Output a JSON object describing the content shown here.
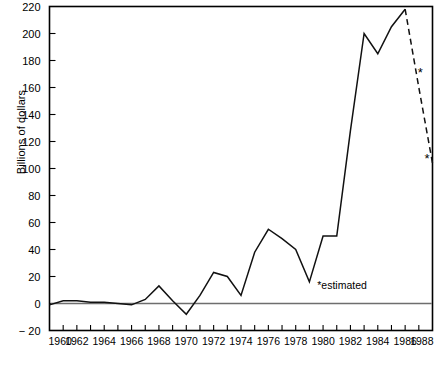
{
  "chart_data": {
    "type": "line",
    "title": "",
    "subtitle": "",
    "xlabel": "",
    "ylabel": "Billions of dollars",
    "xlim": [
      1960,
      1988
    ],
    "ylim": [
      -20,
      220
    ],
    "ytick_step": 20,
    "xtick_step": 1,
    "grid": false,
    "legend_position": "none",
    "yticks": [
      -20,
      0,
      20,
      40,
      60,
      80,
      100,
      120,
      140,
      160,
      180,
      200,
      220
    ],
    "ytick_labels": [
      "− 20",
      "0",
      "20",
      "40",
      "60",
      "80",
      "100",
      "120",
      "140",
      "160",
      "180",
      "200",
      "220"
    ],
    "xticks": [
      1960,
      1962,
      1964,
      1966,
      1968,
      1970,
      1972,
      1974,
      1976,
      1978,
      1980,
      1982,
      1984,
      1986,
      1988
    ],
    "xtick_labels": [
      "1960",
      "1962",
      "1964",
      "1966",
      "1968",
      "1970",
      "1972",
      "1974",
      "1976",
      "1978",
      "1980",
      "1982",
      "1984",
      "1986",
      "1988"
    ],
    "series": [
      {
        "name": "actual",
        "style": "solid",
        "x": [
          1960,
          1961,
          1962,
          1963,
          1964,
          1965,
          1966,
          1967,
          1968,
          1969,
          1970,
          1971,
          1972,
          1973,
          1974,
          1975,
          1976,
          1977,
          1978,
          1979,
          1980,
          1981,
          1982,
          1983,
          1984,
          1985,
          1986
        ],
        "values": [
          -1,
          2,
          2,
          1,
          1,
          0,
          -1,
          3,
          13,
          2,
          -8,
          6,
          23,
          20,
          6,
          38,
          55,
          48,
          40,
          16,
          50,
          50,
          128,
          200,
          185,
          205,
          218
        ]
      },
      {
        "name": "estimated",
        "style": "dashed",
        "x": [
          1986,
          1987,
          1988
        ],
        "values": [
          218,
          160,
          104
        ]
      }
    ],
    "annotations": [
      {
        "name": "estimate-marker-1987",
        "text": "*",
        "x": 1987.1,
        "y": 168
      },
      {
        "name": "estimate-marker-1988",
        "text": "*",
        "x": 1987.6,
        "y": 104
      },
      {
        "name": "estimated-footnote",
        "text": "*estimated",
        "x": 1983.2,
        "y": 11
      }
    ],
    "colors": {
      "line": "#111111",
      "zero_line": "#6e6e6e",
      "axis": "#000000",
      "background": "#ffffff"
    }
  }
}
